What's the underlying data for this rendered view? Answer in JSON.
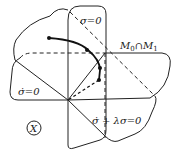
{
  "diagram": {
    "type": "geometric-manifold-intersection",
    "labels": {
      "sigma_zero": "σ=0",
      "sigma_dot_zero": "σ̇=0",
      "sliding_surface": "σ̇ + λσ=0",
      "intersection_M": "M",
      "intersection_sub0": "0",
      "intersection_cap": "∩",
      "intersection_M1": "M",
      "intersection_sub1": "1",
      "space_symbol": "X"
    },
    "elements": [
      {
        "name": "plane-sigma-zero",
        "label": "σ=0",
        "orientation": "vertical"
      },
      {
        "name": "plane-sigma-dot-zero",
        "label": "σ̇=0",
        "orientation": "horizontal"
      },
      {
        "name": "plane-sigma-dot-plus-lambda-sigma",
        "label": "σ̇ + λσ=0",
        "orientation": "diagonal"
      },
      {
        "name": "intersection-line",
        "label": "M0 ∩ M1"
      },
      {
        "name": "trajectory",
        "points": 4
      }
    ]
  }
}
